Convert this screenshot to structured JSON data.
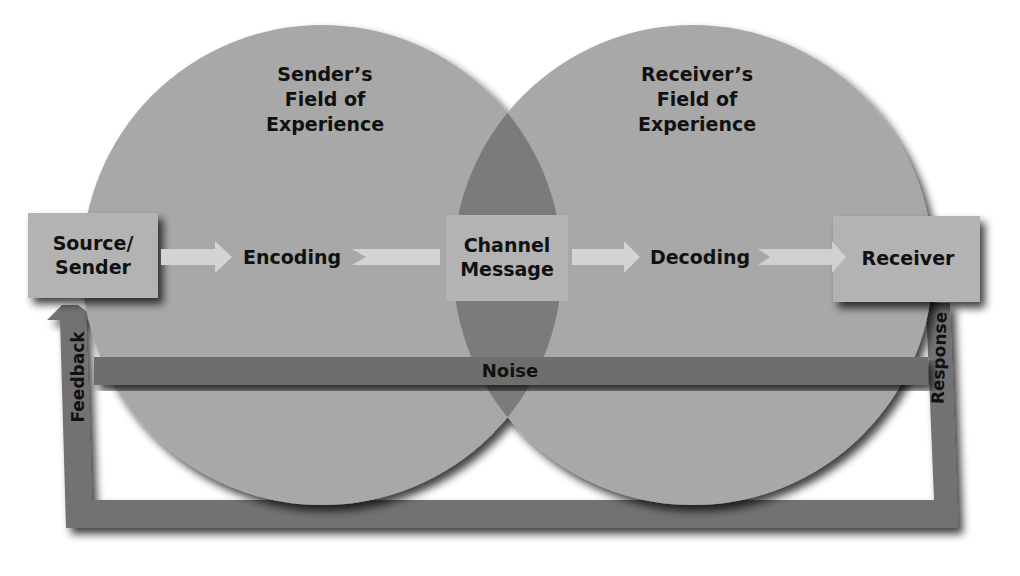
{
  "diagram": {
    "colors": {
      "circle": "#a8a8a8",
      "overlap": "#7b7b7b",
      "box": "#b3b3b3",
      "noise_bar": "#6e6e6e",
      "feedback_frame": "#727272",
      "arrow": "#d4d4d4",
      "text": "#111111",
      "background": "#ffffff"
    },
    "fields": {
      "sender": {
        "line1": "Sender’s",
        "line2": "Field of",
        "line3": "Experience"
      },
      "receiver": {
        "line1": "Receiver’s",
        "line2": "Field of",
        "line3": "Experience"
      }
    },
    "nodes": {
      "source": {
        "line1": "Source/",
        "line2": "Sender"
      },
      "encoding": {
        "label": "Encoding"
      },
      "channel": {
        "line1": "Channel",
        "line2": "Message"
      },
      "decoding": {
        "label": "Decoding"
      },
      "receiver": {
        "label": "Receiver"
      }
    },
    "noise": {
      "label": "Noise"
    },
    "feedback": {
      "label": "Feedback"
    },
    "response": {
      "label": "Response"
    },
    "flow": [
      "Source/Sender",
      "Encoding",
      "Channel Message",
      "Decoding",
      "Receiver"
    ]
  }
}
